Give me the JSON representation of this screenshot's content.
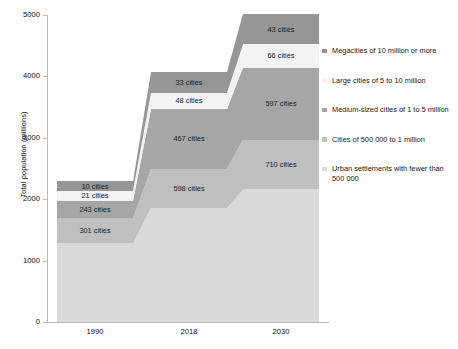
{
  "chart_data": {
    "type": "bar",
    "subtype": "stacked-bar-with-flow-bands",
    "title": "",
    "xlabel": "",
    "ylabel": "Total population (millions)",
    "categories": [
      "1990",
      "2018",
      "2030"
    ],
    "ylim": [
      0,
      5000
    ],
    "y_ticks": [
      0,
      1000,
      2000,
      3000,
      4000,
      5000
    ],
    "y_tick_labels": [
      "0",
      "1000",
      "2000",
      "3000",
      "4000",
      "5000"
    ],
    "grid": false,
    "legend_position": "right",
    "stack_order_bottom_to_top": [
      "Urban settlements with fewer than 500 000",
      "Cities of 500 000 to 1 million",
      "Medium-sized cities of 1 to 5 million",
      "Large cities of 5 to 10 million",
      "Megacities of 10 million or more"
    ],
    "series": [
      {
        "name": "Megacities of 10 million or more",
        "color": "#969696",
        "values": [
          150,
          335,
          500
        ],
        "labels": [
          "10 cities",
          "33 cities",
          "43 cities"
        ]
      },
      {
        "name": "Large cities of 5 to 10 million",
        "color": "#f2f2f2",
        "values": [
          170,
          265,
          375
        ],
        "labels": [
          "21 cities",
          "48 cities",
          "66 cities"
        ]
      },
      {
        "name": "Medium-sized cities of 1 to 5 million",
        "color": "#a6a6a6",
        "values": [
          280,
          975,
          1175
        ],
        "labels": [
          "243 cities",
          "467 cities",
          "597 cities"
        ]
      },
      {
        "name": "Cities of 500 000 to 1 million",
        "color": "#bfbfbf",
        "values": [
          410,
          640,
          810
        ],
        "labels": [
          "301 cities",
          "598 cities",
          "710 cities"
        ]
      },
      {
        "name": "Urban settlements with fewer than 500 000",
        "color": "#d9d9d9",
        "values": [
          1280,
          1855,
          2160
        ],
        "labels": [
          "",
          "",
          ""
        ]
      }
    ],
    "totals": [
      2290,
      4070,
      5020
    ]
  },
  "legend": {
    "items": [
      {
        "label": "Megacities of 10 million or more",
        "color": "#969696"
      },
      {
        "label": "Large cities of 5 to 10 million",
        "color": "#f2f2f2"
      },
      {
        "label": "Medium-sized cities of 1 to 5 million",
        "color": "#a6a6a6"
      },
      {
        "label": "Cities of 500 000 to 1 million",
        "color": "#bfbfbf"
      },
      {
        "label": "Urban settlements with fewer than 500 000",
        "color": "#d9d9d9"
      }
    ]
  }
}
